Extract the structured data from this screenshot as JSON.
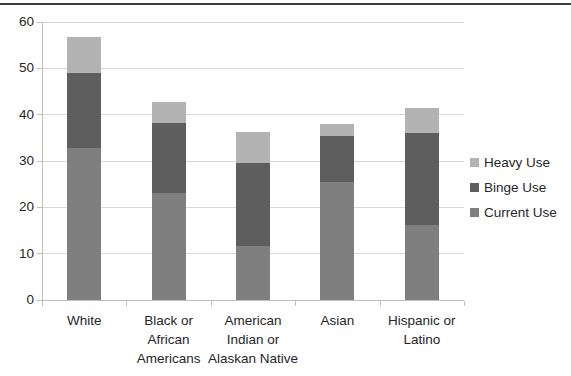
{
  "page": {
    "top_border_color": "#3c3c3c",
    "background": "#ffffff"
  },
  "chart_data": {
    "type": "bar",
    "stacked": true,
    "title": "",
    "xlabel": "",
    "ylabel": "",
    "categories": [
      "White",
      "Black or African Americans",
      "American Indian or Alaskan Native",
      "Asian",
      "Hispanic or Latino"
    ],
    "category_display_lines": [
      "White",
      "Black or\nAfrican\nAmericans",
      "American\nIndian or\nAlaskan Native",
      "Asian",
      "Hispanic or\nLatino"
    ],
    "series": [
      {
        "name": "Current Use",
        "color": "#7f7f7f",
        "values": [
          32.8,
          23.0,
          11.7,
          25.5,
          16.2
        ]
      },
      {
        "name": "Binge Use",
        "color": "#5e5e5e",
        "values": [
          16.1,
          15.3,
          17.9,
          10.0,
          19.9
        ]
      },
      {
        "name": "Heavy Use",
        "color": "#b3b3b3",
        "values": [
          7.8,
          4.5,
          6.6,
          2.4,
          5.3
        ]
      }
    ],
    "stack_totals": [
      56.7,
      42.8,
      36.2,
      37.9,
      41.4
    ],
    "ylim": [
      0,
      60
    ],
    "yticks": [
      0,
      10,
      20,
      30,
      40,
      50,
      60
    ],
    "grid": true,
    "legend_position": "right",
    "legend_order_top_to_bottom": [
      "Heavy Use",
      "Binge Use",
      "Current Use"
    ],
    "colors": {
      "gridline": "#d9d9d9",
      "axis": "#bfbfbf",
      "tick": "#bfbfbf",
      "text": "#262626"
    }
  }
}
